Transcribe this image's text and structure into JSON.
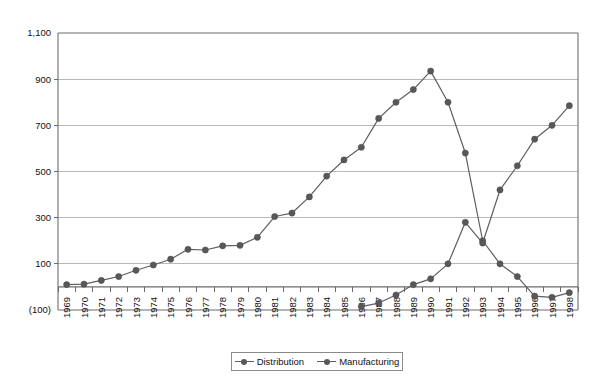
{
  "chart_data": {
    "type": "line",
    "title": "",
    "subtitle": "",
    "xlabel": "",
    "ylabel": "",
    "grid": true,
    "legend_position": "bottom",
    "ylim": [
      -100,
      1100
    ],
    "yticks": [
      -100,
      100,
      300,
      500,
      700,
      900,
      1100
    ],
    "ytick_labels": [
      "(100)",
      "100",
      "300",
      "500",
      "700",
      "900",
      "1,100"
    ],
    "categories": [
      "1969",
      "1970",
      "1971",
      "1972",
      "1973",
      "1974",
      "1975",
      "1976",
      "1977",
      "1978",
      "1979",
      "1980",
      "1981",
      "1982",
      "1983",
      "1984",
      "1985",
      "1986",
      "1987",
      "1988",
      "1989",
      "1990",
      "1991",
      "1992",
      "1993",
      "1994",
      "1995",
      "1996",
      "1997",
      "1998"
    ],
    "series": [
      {
        "name": "Distribution",
        "color": "#585858",
        "values": [
          10,
          12,
          28,
          45,
          72,
          95,
          120,
          163,
          160,
          178,
          180,
          215,
          305,
          320,
          390,
          480,
          550,
          605,
          730,
          800,
          855,
          935,
          800,
          580,
          200,
          100,
          45,
          -40,
          -45,
          -25
        ]
      },
      {
        "name": "Manufacturing",
        "color": "#585858",
        "values": [
          null,
          null,
          null,
          null,
          null,
          null,
          null,
          null,
          null,
          null,
          null,
          null,
          null,
          null,
          null,
          null,
          null,
          -85,
          -70,
          -35,
          10,
          35,
          100,
          280,
          190,
          420,
          525,
          640,
          700,
          785
        ]
      }
    ]
  },
  "legend": {
    "items": [
      {
        "label": "Distribution",
        "marker": "circle-line-marker"
      },
      {
        "label": "Manufacturing",
        "marker": "circle-line-marker"
      }
    ]
  },
  "colors": {
    "series": "#585858",
    "grid": "#a6a6a6",
    "axis": "#6d6d6d",
    "text": "#111111",
    "background": "#ffffff"
  }
}
